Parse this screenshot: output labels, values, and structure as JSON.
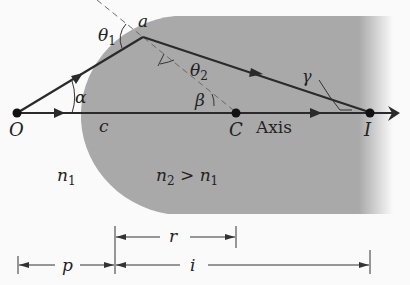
{
  "colors": {
    "background": "#fafafa",
    "medium2": "#a9a9a9",
    "ray": "#2a2a2a",
    "dashed_normal": "#6a6a6a"
  },
  "points": {
    "O": "O",
    "a": "a",
    "C": "C",
    "I": "I"
  },
  "angles": {
    "theta1": "θ",
    "theta1_sub": "1",
    "theta2": "θ",
    "theta2_sub": "2",
    "alpha": "α",
    "beta": "β",
    "gamma": "γ"
  },
  "labels": {
    "c": "c",
    "axis": "Axis",
    "n1": "n",
    "n1_sub": "1",
    "n2": "n",
    "n2_sub": "2",
    "n2_cmp": " > ",
    "n2_rhs": "n",
    "n2_rhs_sub": "1"
  },
  "dimensions": {
    "r": "r",
    "p": "p",
    "i": "i"
  }
}
